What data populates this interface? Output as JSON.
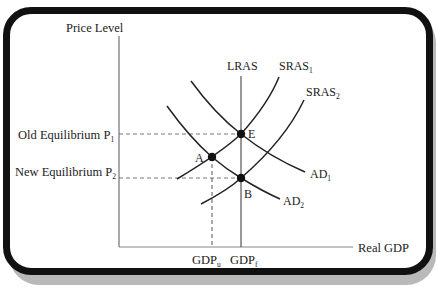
{
  "diagram": {
    "type": "economics-ad-as",
    "axes": {
      "y_label": "Price Level",
      "x_label": "Real GDP"
    },
    "price_levels": [
      {
        "label": "Old Equilibrium P",
        "sub": "1"
      },
      {
        "label": "New Equilibrium P",
        "sub": "2"
      }
    ],
    "gdp_levels": [
      {
        "label": "GDP",
        "sub": "u"
      },
      {
        "label": "GDP",
        "sub": "f"
      }
    ],
    "curves": {
      "lras": {
        "label": "LRAS"
      },
      "sras1": {
        "label": "SRAS",
        "sub": "1"
      },
      "sras2": {
        "label": "SRAS",
        "sub": "2"
      },
      "ad1": {
        "label": "AD",
        "sub": "1"
      },
      "ad2": {
        "label": "AD",
        "sub": "2"
      }
    },
    "points": [
      {
        "label": "E"
      },
      {
        "label": "A"
      },
      {
        "label": "B"
      }
    ],
    "colors": {
      "ink": "#222222",
      "frame": "#111111",
      "shadow": "#b9b9b9",
      "axis": "#555555",
      "dash": "#666666"
    }
  }
}
